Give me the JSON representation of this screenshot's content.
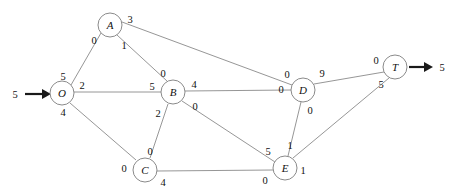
{
  "diagram": {
    "type": "network-flow-graph",
    "width": 455,
    "height": 196,
    "edge_color": "#8a8a8a",
    "node_color": "#7d7d7d",
    "arrow_color": "#1a1a1a",
    "background": "#ffffff"
  },
  "nodes": [
    {
      "id": "O",
      "label": "O",
      "x": 62,
      "y": 93,
      "r": 12
    },
    {
      "id": "A",
      "label": "A",
      "x": 110,
      "y": 25,
      "r": 12
    },
    {
      "id": "B",
      "label": "B",
      "x": 173,
      "y": 92,
      "r": 12
    },
    {
      "id": "C",
      "label": "C",
      "x": 145,
      "y": 170,
      "r": 12
    },
    {
      "id": "D",
      "label": "D",
      "x": 303,
      "y": 90,
      "r": 12
    },
    {
      "id": "E",
      "label": "E",
      "x": 285,
      "y": 168,
      "r": 12
    },
    {
      "id": "T",
      "label": "T",
      "x": 395,
      "y": 67,
      "r": 12
    }
  ],
  "edges": [
    {
      "from": "O",
      "to": "A",
      "tail_label": "5",
      "head_label": "0",
      "tail_label_x": 63,
      "tail_label_y": 76,
      "head_label_x": 94,
      "head_label_y": 40
    },
    {
      "from": "O",
      "to": "B",
      "tail_label": "2",
      "head_label": "5",
      "tail_label_x": 82,
      "tail_label_y": 85,
      "head_label_x": 152,
      "head_label_y": 86
    },
    {
      "from": "O",
      "to": "C",
      "tail_label": "4",
      "head_label": "0",
      "tail_label_x": 63,
      "tail_label_y": 112,
      "head_label_x": 124,
      "head_label_y": 168
    },
    {
      "from": "A",
      "to": "B",
      "tail_label": "1",
      "head_label": "0",
      "tail_label_x": 124,
      "tail_label_y": 45,
      "head_label_x": 163,
      "head_label_y": 73
    },
    {
      "from": "A",
      "to": "D",
      "tail_label": "3",
      "head_label": "0",
      "tail_label_x": 130,
      "tail_label_y": 19,
      "head_label_x": 287,
      "head_label_y": 74
    },
    {
      "from": "B",
      "to": "C",
      "tail_label": "2",
      "head_label": "0",
      "tail_label_x": 158,
      "tail_label_y": 113,
      "head_label_x": 150,
      "head_label_y": 151
    },
    {
      "from": "B",
      "to": "D",
      "tail_label": "4",
      "head_label": "0",
      "tail_label_x": 194,
      "tail_label_y": 84,
      "head_label_x": 281,
      "head_label_y": 89
    },
    {
      "from": "B",
      "to": "E",
      "tail_label": "0",
      "head_label": "5",
      "tail_label_x": 195,
      "tail_label_y": 106,
      "head_label_x": 268,
      "head_label_y": 151
    },
    {
      "from": "C",
      "to": "E",
      "tail_label": "4",
      "head_label": "0",
      "tail_label_x": 163,
      "tail_label_y": 182,
      "head_label_x": 265,
      "head_label_y": 180
    },
    {
      "from": "D",
      "to": "E",
      "tail_label": "0",
      "head_label": "1",
      "tail_label_x": 310,
      "tail_label_y": 110,
      "head_label_x": 290,
      "head_label_y": 145
    },
    {
      "from": "D",
      "to": "T",
      "tail_label": "9",
      "head_label": "0",
      "tail_label_x": 322,
      "tail_label_y": 73,
      "head_label_x": 376,
      "head_label_y": 60
    },
    {
      "from": "E",
      "to": "T",
      "tail_label": "1",
      "head_label": "5",
      "tail_label_x": 303,
      "tail_label_y": 170,
      "head_label_x": 381,
      "head_label_y": 84
    }
  ],
  "terminals": {
    "source": {
      "label": "5",
      "label_x": 15,
      "label_y": 94,
      "arrow_from_x": 25,
      "arrow_to_x": 48,
      "arrow_y": 94
    },
    "sink": {
      "label": "5",
      "label_x": 442,
      "label_y": 67,
      "arrow_from_x": 409,
      "arrow_to_x": 430,
      "arrow_y": 67
    }
  }
}
